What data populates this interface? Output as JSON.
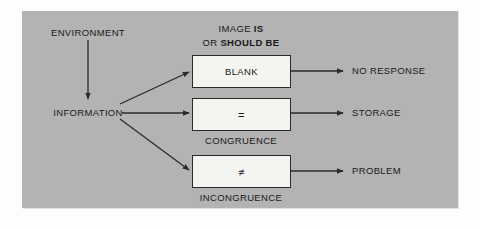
{
  "diagram": {
    "title_lines": [
      {
        "plain": "IMAGE ",
        "bold": "IS"
      },
      {
        "plain": "OR ",
        "bold": "SHOULD BE"
      }
    ],
    "title_line_1_plain": "IMAGE ",
    "title_line_1_bold": "IS",
    "title_line_2_plain": "OR ",
    "title_line_2_bold": "SHOULD BE",
    "inputs": {
      "environment": "ENVIRONMENT",
      "information": "INFORMATION"
    },
    "boxes": [
      {
        "label": "BLANK",
        "sublabel": ""
      },
      {
        "label": "=",
        "sublabel": "CONGRUENCE"
      },
      {
        "label": "≠",
        "sublabel": "INCONGRUENCE"
      }
    ],
    "outputs": [
      {
        "label": "NO RESPONSE"
      },
      {
        "label": "STORAGE"
      },
      {
        "label": "PROBLEM"
      }
    ],
    "colors": {
      "panel_background": "#b3b3b3",
      "page_background": "#fdfdfd",
      "box_fill": "#f4f4f1",
      "stroke": "#2b2b2b",
      "text": "#1a1a1a"
    }
  }
}
